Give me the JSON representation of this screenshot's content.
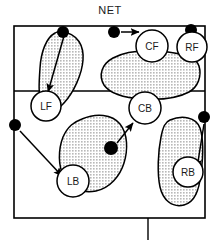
{
  "diagram": {
    "title": "NET",
    "type": "volleyball-court-coverage-diagram",
    "court": {
      "outline_color": "#000000",
      "fill_color": "#ffffff",
      "attack_line_label": "",
      "baseline_tick": true
    },
    "colors": {
      "zone_fill": "#d0d0d0",
      "zone_stroke": "#000000",
      "marker_fill": "#000000",
      "arrow_color": "#000000",
      "player_circle_fill": "#ffffff",
      "text_color": "#1a1a1a"
    },
    "players": [
      {
        "id": "lf",
        "label": "LF",
        "name": "left-front",
        "cx": 46,
        "cy": 106,
        "r": 15
      },
      {
        "id": "cf",
        "label": "CF",
        "name": "center-front",
        "cx": 152,
        "cy": 46,
        "r": 16
      },
      {
        "id": "rf",
        "label": "RF",
        "name": "right-front",
        "cx": 192,
        "cy": 47,
        "r": 15
      },
      {
        "id": "cb",
        "label": "CB",
        "name": "center-back",
        "cx": 145,
        "cy": 108,
        "r": 16
      },
      {
        "id": "lb",
        "label": "LB",
        "name": "left-back",
        "cx": 73,
        "cy": 181,
        "r": 16
      },
      {
        "id": "rb",
        "label": "RB",
        "name": "right-back",
        "cx": 188,
        "cy": 172,
        "r": 15
      }
    ],
    "ball_markers": [
      {
        "id": "m1",
        "name": "ball-marker-left-net",
        "cx": 63,
        "cy": 32,
        "r": 6
      },
      {
        "id": "m2",
        "name": "ball-marker-center-net",
        "cx": 114,
        "cy": 32,
        "r": 6
      },
      {
        "id": "m3",
        "name": "ball-marker-right-net",
        "cx": 191,
        "cy": 30,
        "r": 6
      },
      {
        "id": "m4",
        "name": "ball-marker-left-side",
        "cx": 15,
        "cy": 125,
        "r": 6
      },
      {
        "id": "m5",
        "name": "ball-marker-mid-court",
        "cx": 111,
        "cy": 148,
        "r": 7
      },
      {
        "id": "m6",
        "name": "ball-marker-right-side",
        "cx": 204,
        "cy": 117,
        "r": 6
      }
    ],
    "movement_arrows": [
      {
        "id": "a1",
        "name": "arrow-net-to-lf",
        "x1": 64,
        "y1": 36,
        "x2": 48,
        "y2": 90
      },
      {
        "id": "a2",
        "name": "arrow-net-to-cf",
        "x1": 121,
        "y1": 32,
        "x2": 140,
        "y2": 32
      },
      {
        "id": "a3",
        "name": "arrow-left-to-lb",
        "x1": 20,
        "y1": 131,
        "x2": 62,
        "y2": 175
      },
      {
        "id": "a4",
        "name": "arrow-mid-to-cb",
        "x1": 117,
        "y1": 143,
        "x2": 134,
        "y2": 122
      },
      {
        "id": "a5",
        "name": "arrow-right-to-rb",
        "x1": 204,
        "y1": 124,
        "x2": 198,
        "y2": 167
      }
    ],
    "coverage_zones": [
      {
        "id": "z1",
        "name": "coverage-zone-left-front"
      },
      {
        "id": "z2",
        "name": "coverage-zone-center-front"
      },
      {
        "id": "z3",
        "name": "coverage-zone-left-back"
      },
      {
        "id": "z4",
        "name": "coverage-zone-right-back"
      }
    ]
  }
}
